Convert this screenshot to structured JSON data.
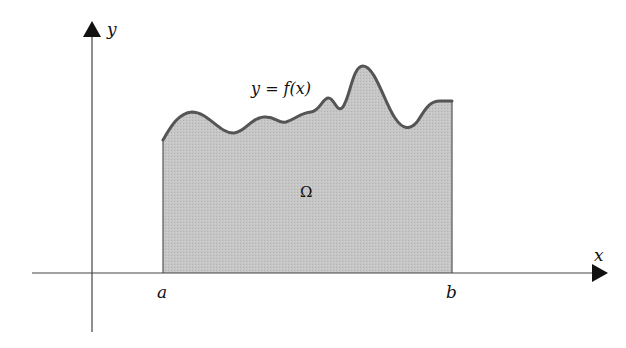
{
  "diagram": {
    "type": "area-under-curve",
    "axes": {
      "x_label": "x",
      "y_label": "y"
    },
    "interval": {
      "left_label": "a",
      "right_label": "b"
    },
    "curve_label": "y = f(x)",
    "region_label": "Ω",
    "colors": {
      "fill": "#c4c4c4",
      "curve": "#555555",
      "axis": "#444444",
      "arrow": "#111111",
      "background": "#ffffff"
    }
  }
}
